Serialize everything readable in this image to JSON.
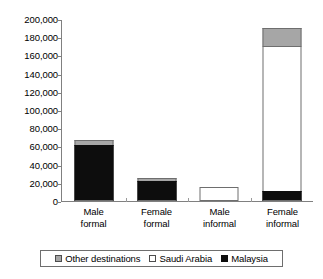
{
  "chart_data": {
    "type": "bar",
    "subtype": "stacked-vertical",
    "title": "",
    "xlabel": "",
    "ylabel": "",
    "ylim": [
      0,
      200000
    ],
    "ytick_step": 20000,
    "grid": false,
    "legend_position": "bottom",
    "categories": [
      "Male formal",
      "Female formal",
      "Male informal",
      "Female informal"
    ],
    "category_lines": [
      [
        "Male",
        "formal"
      ],
      [
        "Female",
        "formal"
      ],
      [
        "Male",
        "informal"
      ],
      [
        "Female",
        "informal"
      ]
    ],
    "ytick_labels": [
      "200,000",
      "180,000",
      "160,000",
      "140,000",
      "120,000",
      "100,000",
      "80,000",
      "60,000",
      "40,000",
      "20,000",
      "0"
    ],
    "ytick_values": [
      200000,
      180000,
      160000,
      140000,
      120000,
      100000,
      80000,
      60000,
      40000,
      20000,
      0
    ],
    "series": [
      {
        "name": "Malaysia",
        "color": "#0d0d0d",
        "values": [
          61500,
          22000,
          0,
          11000
        ]
      },
      {
        "name": "Saudi Arabia",
        "color": "#ffffff",
        "values": [
          0,
          0,
          15000,
          159000
        ]
      },
      {
        "name": "Other destinations",
        "color": "#a6a6a6",
        "values": [
          5500,
          3000,
          0,
          20000
        ]
      }
    ],
    "totals": [
      67000,
      25000,
      15000,
      190000
    ],
    "legend": [
      {
        "label": "Other destinations",
        "swatch": "swatch-gray"
      },
      {
        "label": "Saudi Arabia",
        "swatch": "swatch-white"
      },
      {
        "label": "Malaysia",
        "swatch": "swatch-black"
      }
    ]
  }
}
